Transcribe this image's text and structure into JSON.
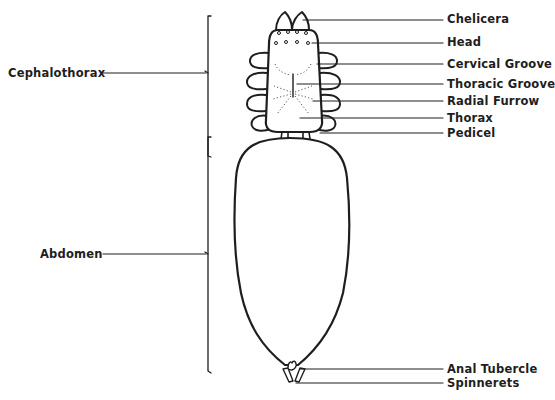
{
  "diagram": {
    "colors": {
      "ink": "#1e1e1e",
      "background": "#ffffff",
      "dots": "#555555"
    },
    "left_labels": [
      {
        "id": "cephalothorax",
        "text": "Cephalothorax",
        "x": 8,
        "y": 66,
        "line_y": 73
      },
      {
        "id": "abdomen",
        "text": "Abdomen",
        "x": 40,
        "y": 247,
        "line_y": 254
      }
    ],
    "right_labels": [
      {
        "id": "chelicera",
        "text": "Chelicera",
        "x": 447,
        "y": 12,
        "line_y": 20
      },
      {
        "id": "head",
        "text": "Head",
        "x": 447,
        "y": 35,
        "line_y": 43
      },
      {
        "id": "cervical-groove",
        "text": "Cervical Groove",
        "x": 447,
        "y": 57,
        "line_y": 64
      },
      {
        "id": "thoracic-groove",
        "text": "Thoracic Groove",
        "x": 447,
        "y": 77,
        "line_y": 84
      },
      {
        "id": "radial-furrow",
        "text": "Radial Furrow",
        "x": 447,
        "y": 94,
        "line_y": 101
      },
      {
        "id": "thorax",
        "text": "Thorax",
        "x": 447,
        "y": 111,
        "line_y": 118
      },
      {
        "id": "pedicel",
        "text": "Pedicel",
        "x": 447,
        "y": 129,
        "line_y": 133
      },
      {
        "id": "anal-tubercle",
        "text": "Anal Tubercle",
        "x": 447,
        "y": 362,
        "line_y": 369
      },
      {
        "id": "spinnerets",
        "text": "Spinnerets",
        "x": 447,
        "y": 377,
        "line_y": 383
      }
    ]
  }
}
